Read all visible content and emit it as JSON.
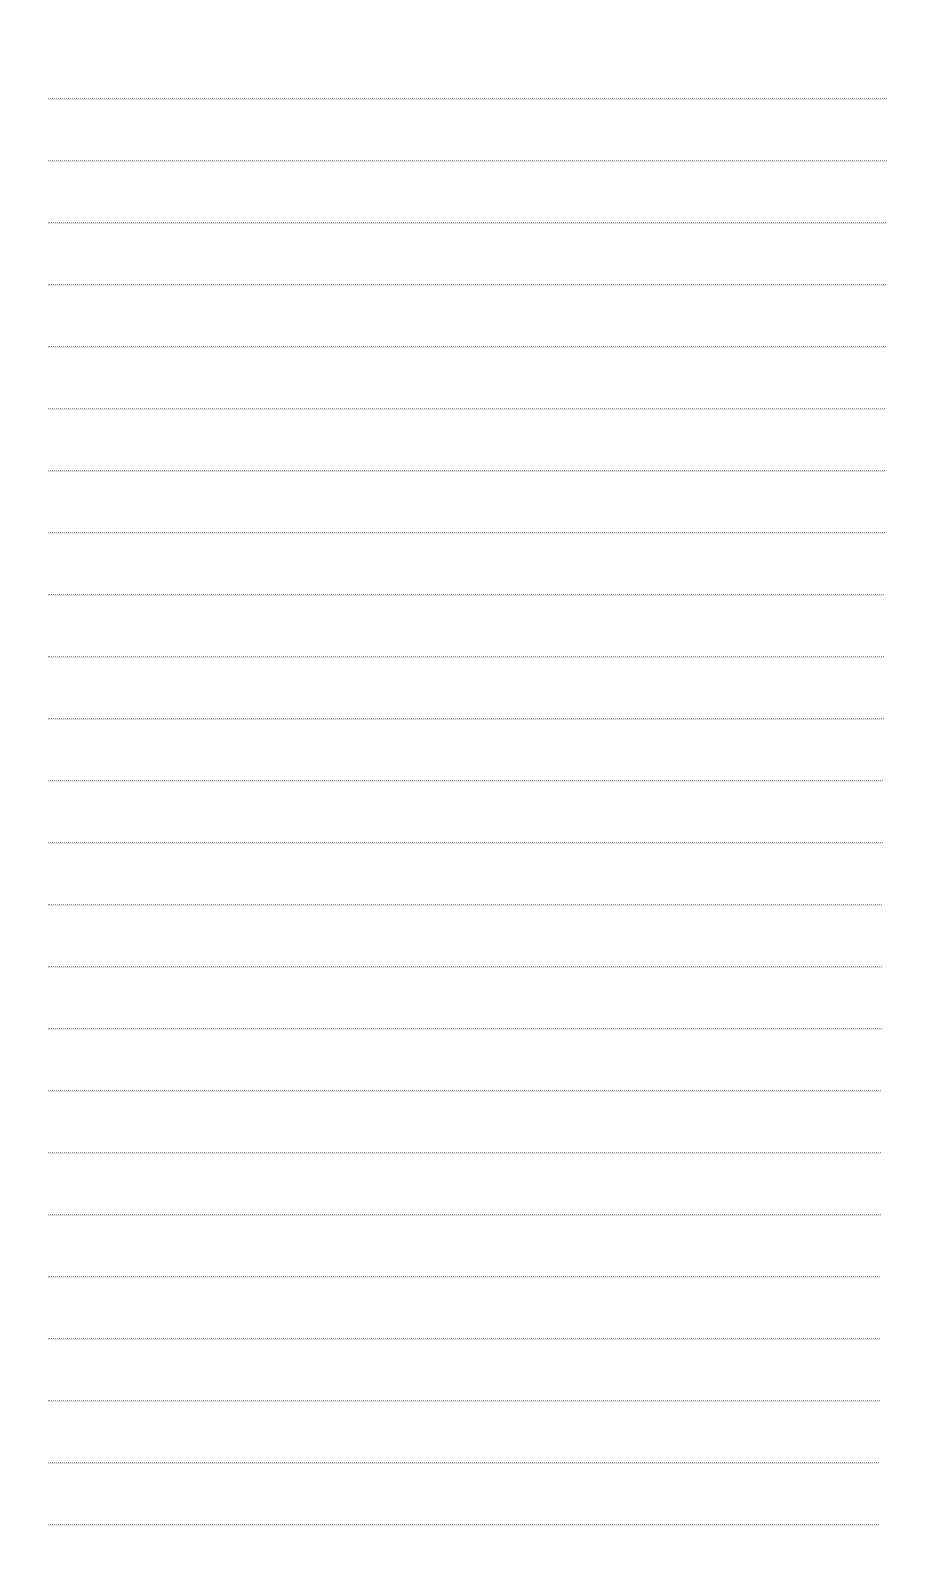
{
  "page": {
    "type": "ruled-paper",
    "background": "#ffffff",
    "line_color": "#8f8f8f",
    "line_count": 24,
    "first_line_y": 98,
    "last_line_y": 1524,
    "line_left_x": 48,
    "line_right_x": 884
  }
}
